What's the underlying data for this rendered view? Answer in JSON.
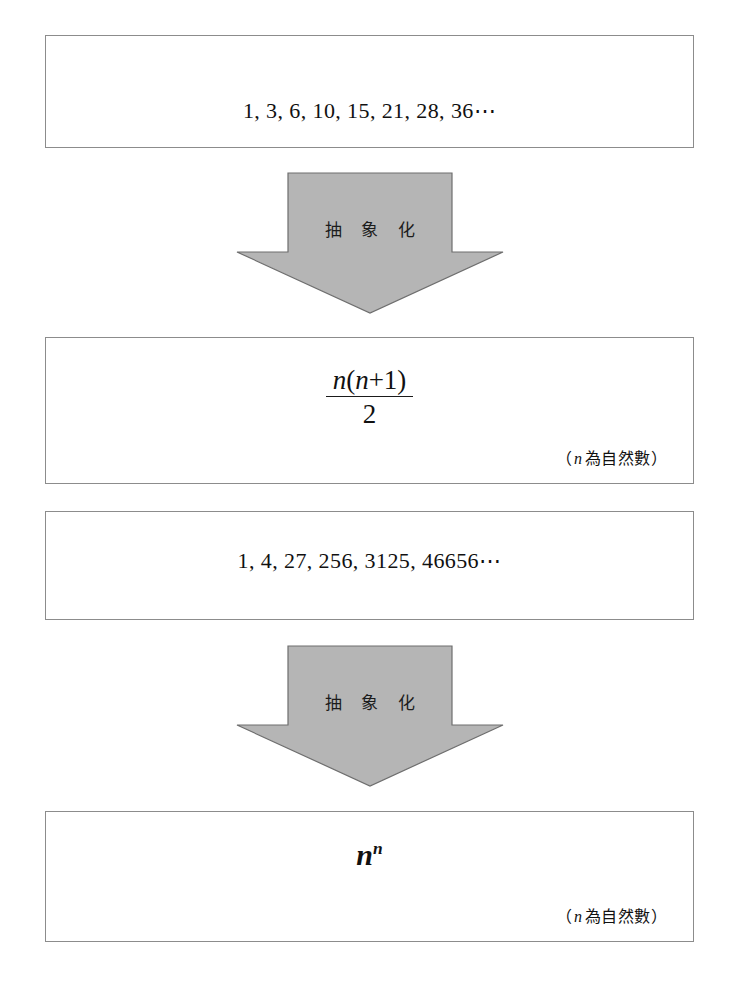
{
  "diagram": {
    "background_color": "#ffffff",
    "box_border_color": "#8c8c8c",
    "arrow_fill_color": "#b5b5b5",
    "arrow_stroke_color": "#6e6e6e",
    "steps": [
      {
        "id": "sequence-triangular",
        "kind": "sequence",
        "text": "1, 3, 6, 10, 15, 21, 28, 36⋯"
      },
      {
        "id": "abstraction-arrow-1",
        "kind": "arrow",
        "label": "抽 象 化"
      },
      {
        "id": "formula-triangular",
        "kind": "formula-fraction",
        "numerator_var": "n",
        "numerator_rest": "(",
        "numerator_inner_var": "n",
        "numerator_tail": "+1)",
        "denominator": "2",
        "note_open": "（",
        "note_var": "n",
        "note_text": "為自然數",
        "note_close": "）"
      },
      {
        "id": "sequence-power",
        "kind": "sequence",
        "text": "1, 4, 27, 256, 3125, 46656⋯"
      },
      {
        "id": "abstraction-arrow-2",
        "kind": "arrow",
        "label": "抽 象 化"
      },
      {
        "id": "formula-power",
        "kind": "formula-power",
        "base": "n",
        "exponent": "n",
        "note_open": "（",
        "note_var": "n",
        "note_text": "為自然數",
        "note_close": "）"
      }
    ]
  },
  "boxes": {
    "sequence_1": {
      "text": "1, 3, 6, 10, 15, 21, 28, 36⋯"
    },
    "formula_1": {
      "numerator_var": "n",
      "numerator_open": "(",
      "numerator_var2": "n",
      "numerator_tail": "+1)",
      "denominator": "2",
      "note_open": "（",
      "note_var": "n",
      "note_body": "為自然數",
      "note_close": "）"
    },
    "sequence_2": {
      "text": "1, 4, 27, 256, 3125, 46656⋯"
    },
    "formula_2": {
      "base": "n",
      "exponent": "n",
      "note_open": "（",
      "note_var": "n",
      "note_body": "為自然數",
      "note_close": "）"
    }
  },
  "arrows": {
    "arrow_1": {
      "label": "抽 象 化"
    },
    "arrow_2": {
      "label": "抽 象 化"
    }
  }
}
